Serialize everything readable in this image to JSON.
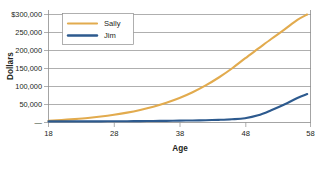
{
  "chart_data": {
    "type": "line",
    "title": "",
    "xlabel": "Age",
    "ylabel": "Dollars",
    "xlim": [
      18,
      58
    ],
    "ylim": [
      0,
      300000
    ],
    "grid": true,
    "legend_position": "top-left",
    "x_ticks": [
      "18",
      "28",
      "38",
      "48",
      "58"
    ],
    "x_tick_values": [
      18,
      28,
      38,
      48,
      58
    ],
    "y_ticks": [
      "$300,000",
      "250,000",
      "200,000",
      "150,000",
      "100,000",
      "50,000",
      "—"
    ],
    "y_tick_values": [
      300000,
      250000,
      200000,
      150000,
      100000,
      50000,
      0
    ],
    "x": [
      18,
      20,
      22,
      24,
      26,
      28,
      30,
      32,
      34,
      36,
      38,
      40,
      42,
      44,
      46,
      48,
      50,
      52,
      54,
      56,
      57.5
    ],
    "series": [
      {
        "name": "Sally",
        "color": "#e2ab4e",
        "values": [
          5000,
          7000,
          9500,
          12500,
          16500,
          21500,
          27500,
          35000,
          44000,
          55000,
          68000,
          84000,
          103000,
          125000,
          150000,
          178000,
          205000,
          232000,
          258000,
          285000,
          300000
        ]
      },
      {
        "name": "Jim",
        "color": "#2d5a8e",
        "values": [
          3000,
          3000,
          3000,
          3100,
          3200,
          3400,
          3600,
          3900,
          4200,
          4600,
          5100,
          5700,
          6400,
          7400,
          9000,
          12000,
          20000,
          34000,
          50000,
          68000,
          79000
        ]
      }
    ]
  },
  "legend": {
    "entries": [
      {
        "label": "Sally",
        "color": "#e2ab4e"
      },
      {
        "label": "Jim",
        "color": "#2d5a8e"
      }
    ]
  },
  "axes": {
    "y_title": "Dollars",
    "x_title": "Age"
  }
}
